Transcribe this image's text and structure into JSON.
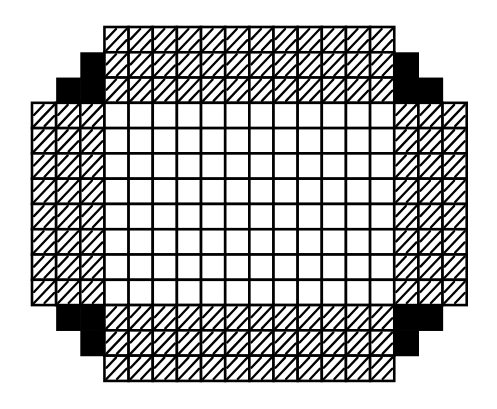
{
  "diagram": {
    "type": "grid-array",
    "colors": {
      "background": "#ffffff",
      "line": "#000000",
      "empty_cell": "#ffffff",
      "hatched_cell": "#ffffff",
      "hatch_stroke": "#000000",
      "filled_cell": "#000000"
    },
    "grid": {
      "origin_x": 32,
      "origin_y": 27,
      "cell_width": 24.15,
      "cell_height": 25.28,
      "columns": 18,
      "rows": 14
    },
    "legend_cell_types": [
      "empty",
      "hatched",
      "filled",
      "none"
    ],
    "cell_map": [
      "...HHHHHHHHHHHH...",
      "..FHHHHHHHHHHHHF..",
      ".FFHHHHHHHHHHHHFF.",
      "HHHEEEEEEEEEEEEHHH",
      "HHHEEEEEEEEEEEEHHH",
      "HHHEEEEEEEEEEEEHHH",
      "HHHEEEEEEEEEEEEHHH",
      "HHHEEEEEEEEEEEEHHH",
      "HHHEEEEEEEEEEEEHHH",
      "HHHEEEEEEEEEEEEHHH",
      "HHHEEEEEEEEEEEEHHH",
      ".FFHHHHHHHHHHHHFF.",
      "..FHHHHHHHHHHHHF..",
      "...HHHHHHHHHHHH..."
    ],
    "regions": {
      "center_empty": {
        "cols": 12,
        "rows": 8
      },
      "top_hatched": {
        "cols": 12,
        "rows": 3
      },
      "bottom_hatched": {
        "cols": 12,
        "rows": 3
      },
      "left_hatched": {
        "cols": 3,
        "rows": 8
      },
      "right_hatched": {
        "cols": 3,
        "rows": 8
      },
      "corner_filled_cells_each": 3
    }
  }
}
